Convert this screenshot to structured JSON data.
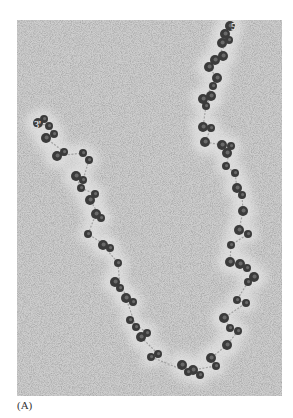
{
  "figure": {
    "panel_label": "(A)",
    "end_labels": {
      "five_prime": "5'",
      "three_prime": "3'"
    },
    "colors": {
      "background": "#c9c9c9",
      "halo": "#e4e4e4",
      "nucleosome": "#3b3b3b",
      "strand": "#8a8a8a"
    },
    "nucleosomes": [
      {
        "x": 213,
        "y": 6,
        "r": 5
      },
      {
        "x": 208,
        "y": 14,
        "r": 5
      },
      {
        "x": 205,
        "y": 23,
        "r": 5
      },
      {
        "x": 212,
        "y": 20,
        "r": 4
      },
      {
        "x": 198,
        "y": 40,
        "r": 5
      },
      {
        "x": 206,
        "y": 36,
        "r": 5
      },
      {
        "x": 192,
        "y": 47,
        "r": 5
      },
      {
        "x": 200,
        "y": 58,
        "r": 5
      },
      {
        "x": 196,
        "y": 66,
        "r": 4
      },
      {
        "x": 186,
        "y": 79,
        "r": 5
      },
      {
        "x": 194,
        "y": 76,
        "r": 5
      },
      {
        "x": 189,
        "y": 86,
        "r": 4
      },
      {
        "x": 186,
        "y": 107,
        "r": 5
      },
      {
        "x": 194,
        "y": 108,
        "r": 4
      },
      {
        "x": 188,
        "y": 122,
        "r": 5
      },
      {
        "x": 205,
        "y": 125,
        "r": 5
      },
      {
        "x": 210,
        "y": 133,
        "r": 5
      },
      {
        "x": 214,
        "y": 126,
        "r": 4
      },
      {
        "x": 209,
        "y": 146,
        "r": 4
      },
      {
        "x": 218,
        "y": 153,
        "r": 4
      },
      {
        "x": 220,
        "y": 168,
        "r": 5
      },
      {
        "x": 225,
        "y": 175,
        "r": 4
      },
      {
        "x": 226,
        "y": 191,
        "r": 5
      },
      {
        "x": 222,
        "y": 210,
        "r": 5
      },
      {
        "x": 231,
        "y": 214,
        "r": 4
      },
      {
        "x": 214,
        "y": 225,
        "r": 4
      },
      {
        "x": 213,
        "y": 242,
        "r": 5
      },
      {
        "x": 223,
        "y": 244,
        "r": 5
      },
      {
        "x": 230,
        "y": 248,
        "r": 4
      },
      {
        "x": 237,
        "y": 257,
        "r": 5
      },
      {
        "x": 231,
        "y": 262,
        "r": 4
      },
      {
        "x": 220,
        "y": 280,
        "r": 4
      },
      {
        "x": 229,
        "y": 283,
        "r": 4
      },
      {
        "x": 207,
        "y": 298,
        "r": 5
      },
      {
        "x": 213,
        "y": 308,
        "r": 4
      },
      {
        "x": 221,
        "y": 311,
        "r": 4
      },
      {
        "x": 210,
        "y": 325,
        "r": 5
      },
      {
        "x": 194,
        "y": 338,
        "r": 5
      },
      {
        "x": 199,
        "y": 346,
        "r": 4
      },
      {
        "x": 176,
        "y": 350,
        "r": 5
      },
      {
        "x": 183,
        "y": 355,
        "r": 4
      },
      {
        "x": 165,
        "y": 345,
        "r": 5
      },
      {
        "x": 171,
        "y": 352,
        "r": 4
      },
      {
        "x": 134,
        "y": 337,
        "r": 4
      },
      {
        "x": 141,
        "y": 334,
        "r": 4
      },
      {
        "x": 124,
        "y": 317,
        "r": 5
      },
      {
        "x": 130,
        "y": 313,
        "r": 4
      },
      {
        "x": 113,
        "y": 300,
        "r": 4
      },
      {
        "x": 119,
        "y": 307,
        "r": 4
      },
      {
        "x": 109,
        "y": 278,
        "r": 5
      },
      {
        "x": 116,
        "y": 282,
        "r": 4
      },
      {
        "x": 98,
        "y": 262,
        "r": 5
      },
      {
        "x": 103,
        "y": 268,
        "r": 4
      },
      {
        "x": 101,
        "y": 243,
        "r": 4
      },
      {
        "x": 86,
        "y": 225,
        "r": 5
      },
      {
        "x": 93,
        "y": 228,
        "r": 4
      },
      {
        "x": 71,
        "y": 214,
        "r": 4
      },
      {
        "x": 79,
        "y": 194,
        "r": 5
      },
      {
        "x": 84,
        "y": 198,
        "r": 4
      },
      {
        "x": 73,
        "y": 180,
        "r": 5
      },
      {
        "x": 78,
        "y": 174,
        "r": 4
      },
      {
        "x": 64,
        "y": 168,
        "r": 4
      },
      {
        "x": 59,
        "y": 156,
        "r": 5
      },
      {
        "x": 66,
        "y": 160,
        "r": 4
      },
      {
        "x": 72,
        "y": 140,
        "r": 4
      },
      {
        "x": 66,
        "y": 133,
        "r": 4
      },
      {
        "x": 40,
        "y": 136,
        "r": 5
      },
      {
        "x": 47,
        "y": 132,
        "r": 4
      },
      {
        "x": 29,
        "y": 118,
        "r": 5
      },
      {
        "x": 37,
        "y": 114,
        "r": 4
      },
      {
        "x": 32,
        "y": 106,
        "r": 4
      },
      {
        "x": 21,
        "y": 103,
        "r": 5
      },
      {
        "x": 27,
        "y": 99,
        "r": 4
      }
    ]
  }
}
